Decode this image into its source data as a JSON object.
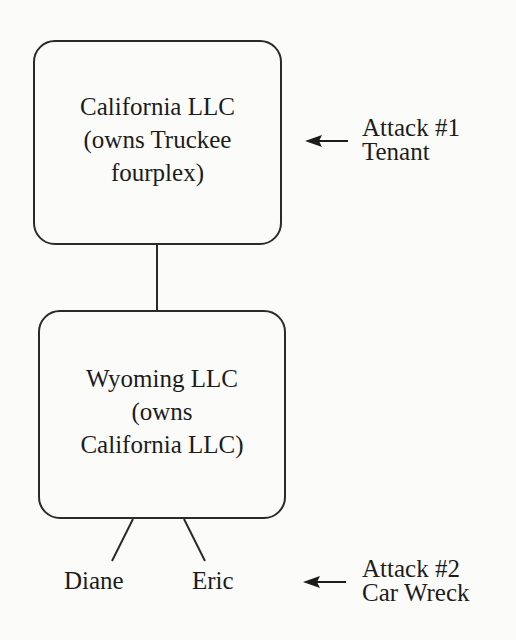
{
  "diagram": {
    "type": "ownership-structure",
    "nodes": [
      {
        "id": "california-llc",
        "lines": [
          "California LLC",
          "(owns Truckee",
          "fourplex)"
        ]
      },
      {
        "id": "wyoming-llc",
        "lines": [
          "Wyoming LLC",
          "(owns",
          "California LLC)"
        ]
      }
    ],
    "owners": [
      "Diane",
      "Eric"
    ],
    "attacks": [
      {
        "target": "california-llc",
        "lines": [
          "Attack #1",
          "Tenant"
        ]
      },
      {
        "target": "owners",
        "lines": [
          "Attack #2",
          "Car Wreck"
        ]
      }
    ],
    "colors": {
      "line": "#2a2a2a",
      "text": "#1c1c1c",
      "background": "#fbfbf9"
    }
  }
}
